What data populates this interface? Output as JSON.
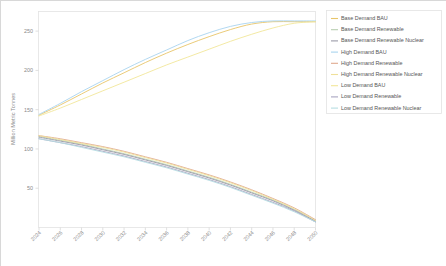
{
  "chart_data": {
    "type": "line",
    "title": "",
    "xlabel": "",
    "ylabel": "Million Metric Tonnes",
    "grid": false,
    "legend_position": "right",
    "xlim": [
      2024,
      2050
    ],
    "ylim": [
      0,
      275
    ],
    "yticks": [
      50,
      100,
      150,
      200,
      250
    ],
    "ytick_labels": [
      "50",
      "100",
      "150",
      "200",
      "250"
    ],
    "x": [
      2024,
      2026,
      2028,
      2030,
      2032,
      2034,
      2036,
      2038,
      2040,
      2042,
      2044,
      2046,
      2048,
      2050
    ],
    "xtick_labels": [
      "2024",
      "2026",
      "2028",
      "2030",
      "2032",
      "2034",
      "2036",
      "2038",
      "2040",
      "2042",
      "2044",
      "2046",
      "2048",
      "2050"
    ],
    "series": [
      {
        "name": "Base Demand BAU",
        "color": "#e8c56a",
        "values": [
          143,
          156,
          170,
          184,
          197,
          210,
          222,
          233,
          243,
          252,
          259,
          262,
          262,
          262
        ]
      },
      {
        "name": "Base Demand Renewable",
        "color": "#b8ceb0",
        "values": [
          116,
          111,
          106,
          100,
          94,
          87,
          80,
          72,
          64,
          55,
          45,
          35,
          23,
          9
        ]
      },
      {
        "name": "Base Demand Renewable Nuclear",
        "color": "#9a9aa8",
        "values": [
          115,
          110,
          105,
          99,
          93,
          86,
          79,
          71,
          63,
          54,
          44,
          34,
          22,
          8
        ]
      },
      {
        "name": "High Demand BAU",
        "color": "#a9d4ef",
        "values": [
          144,
          158,
          173,
          187,
          201,
          214,
          226,
          238,
          248,
          256,
          261,
          263,
          263,
          263
        ]
      },
      {
        "name": "High Demand Renewable",
        "color": "#e0a98e",
        "values": [
          117,
          113,
          108,
          103,
          97,
          90,
          83,
          75,
          67,
          58,
          48,
          37,
          25,
          10
        ]
      },
      {
        "name": "High Demand Renewable Nuclear",
        "color": "#efe09a",
        "values": [
          117,
          112,
          107,
          102,
          96,
          89,
          82,
          74,
          66,
          57,
          47,
          36,
          24,
          9
        ]
      },
      {
        "name": "Low Demand BAU",
        "color": "#f2e79a",
        "values": [
          142,
          152,
          163,
          174,
          185,
          196,
          207,
          217,
          227,
          237,
          246,
          254,
          260,
          262
        ]
      },
      {
        "name": "Low Demand Renewable",
        "color": "#a8a4c0",
        "values": [
          113,
          108,
          103,
          97,
          91,
          84,
          77,
          69,
          61,
          52,
          42,
          32,
          21,
          7
        ]
      },
      {
        "name": "Low Demand Renewable Nuclear",
        "color": "#b6dde2",
        "values": [
          113,
          108,
          102,
          96,
          90,
          83,
          76,
          68,
          60,
          51,
          41,
          31,
          20,
          7
        ]
      }
    ]
  }
}
